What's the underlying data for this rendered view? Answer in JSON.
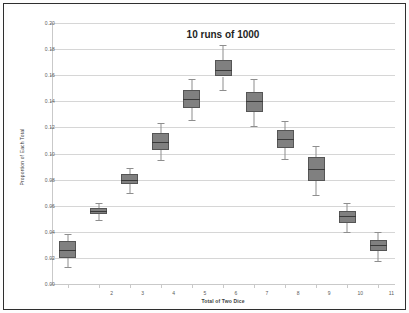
{
  "chart_data": {
    "type": "box",
    "title": "10 runs of 1000",
    "xlabel": "Total of Two Dice",
    "ylabel": "Proportion of Each Total",
    "categories": [
      "2",
      "3",
      "4",
      "5",
      "6",
      "7",
      "8",
      "9",
      "10",
      "11",
      "12"
    ],
    "xtick_labels": [
      "2",
      "3",
      "4",
      "5",
      "6",
      "7",
      "8",
      "9",
      "10",
      "11",
      "12"
    ],
    "ytick_labels": [
      "0.00",
      "0.02",
      "0.04",
      "0.06",
      "0.08",
      "0.10",
      "0.12",
      "0.14",
      "0.16",
      "0.18",
      "0.20"
    ],
    "ytick_values": [
      0.0,
      0.02,
      0.04,
      0.06,
      0.08,
      0.1,
      0.12,
      0.14,
      0.16,
      0.18,
      0.2
    ],
    "ylim": [
      0.0,
      0.2
    ],
    "grid": "horizontal",
    "legend": "none",
    "box_color": "#808080",
    "box_border_color": "#555555",
    "median_color": "#3a3a3a",
    "whisker_color": "#8e8e8e",
    "gridline_color": "#d6d6d6",
    "axis_color": "#c9c9c9",
    "boxes": [
      {
        "category": "2",
        "whisker_low": 0.013,
        "q1": 0.02,
        "median": 0.026,
        "q3": 0.033,
        "whisker_high": 0.038
      },
      {
        "category": "3",
        "whisker_low": 0.049,
        "q1": 0.054,
        "median": 0.056,
        "q3": 0.058,
        "whisker_high": 0.062
      },
      {
        "category": "4",
        "whisker_low": 0.07,
        "q1": 0.077,
        "median": 0.08,
        "q3": 0.084,
        "whisker_high": 0.089
      },
      {
        "category": "5",
        "whisker_low": 0.095,
        "q1": 0.103,
        "median": 0.109,
        "q3": 0.116,
        "whisker_high": 0.123
      },
      {
        "category": "6",
        "whisker_low": 0.126,
        "q1": 0.135,
        "median": 0.142,
        "q3": 0.149,
        "whisker_high": 0.157
      },
      {
        "category": "7",
        "whisker_low": 0.149,
        "q1": 0.159,
        "median": 0.164,
        "q3": 0.172,
        "whisker_high": 0.183
      },
      {
        "category": "8",
        "whisker_low": 0.121,
        "q1": 0.132,
        "median": 0.14,
        "q3": 0.147,
        "whisker_high": 0.157
      },
      {
        "category": "9",
        "whisker_low": 0.096,
        "q1": 0.104,
        "median": 0.111,
        "q3": 0.118,
        "whisker_high": 0.125
      },
      {
        "category": "10",
        "whisker_low": 0.068,
        "q1": 0.079,
        "median": 0.088,
        "q3": 0.097,
        "whisker_high": 0.106
      },
      {
        "category": "11",
        "whisker_low": 0.04,
        "q1": 0.047,
        "median": 0.052,
        "q3": 0.056,
        "whisker_high": 0.062
      },
      {
        "category": "12",
        "whisker_low": 0.018,
        "q1": 0.025,
        "median": 0.03,
        "q3": 0.034,
        "whisker_high": 0.04
      }
    ]
  }
}
